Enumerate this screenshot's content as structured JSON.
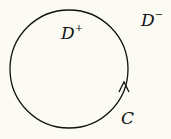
{
  "diagram": {
    "regions": [
      {
        "name": "interior",
        "label": "D",
        "sup": "+"
      },
      {
        "name": "exterior",
        "label": "D",
        "sup": "−"
      }
    ],
    "curve": {
      "label": "C",
      "orientation": "counterclockwise"
    },
    "colors": {
      "background": "#fbfbf4",
      "stroke": "#111111"
    }
  }
}
